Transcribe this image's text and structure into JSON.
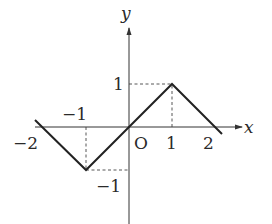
{
  "figure": {
    "type": "function graph",
    "axes": {
      "x_label": "x",
      "y_label": "y",
      "origin_label": "O"
    },
    "ticks": {
      "x_pos_1": "1",
      "x_pos_2": "2",
      "x_neg_1": "−1",
      "x_neg_2": "−2",
      "y_pos_1": "1",
      "y_neg_1": "−1"
    },
    "polyline_points": [
      [
        -2.15,
        0.15
      ],
      [
        -1,
        -1
      ],
      [
        0,
        0
      ],
      [
        1,
        1
      ],
      [
        2.15,
        -0.15
      ]
    ],
    "guide_lines": [
      {
        "from": [
          1,
          0
        ],
        "to": [
          1,
          1
        ]
      },
      {
        "from": [
          0,
          1
        ],
        "to": [
          1,
          1
        ]
      },
      {
        "from": [
          -1,
          0
        ],
        "to": [
          -1,
          -1
        ]
      },
      {
        "from": [
          -1,
          -1
        ],
        "to": [
          0,
          -1
        ]
      }
    ],
    "colors": {
      "line": "#222222",
      "axis": "#333333",
      "text": "#2a2a2a"
    }
  }
}
